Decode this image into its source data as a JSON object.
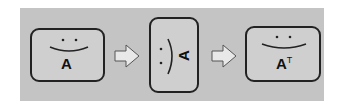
{
  "diagram": {
    "title": "",
    "steps": [
      {
        "id": "original",
        "label": "A",
        "orientation": "upright"
      },
      {
        "id": "rotated",
        "label": "A",
        "orientation": "rotated-90"
      },
      {
        "id": "transposed",
        "label": "A",
        "superscript": "T",
        "orientation": "upright"
      }
    ],
    "arrows": [
      "right-arrow",
      "right-arrow"
    ],
    "colors": {
      "panel": "#c4c4c4",
      "box": "#d0d0d0",
      "border": "#222222",
      "arrow": "#e8e8e8"
    }
  }
}
